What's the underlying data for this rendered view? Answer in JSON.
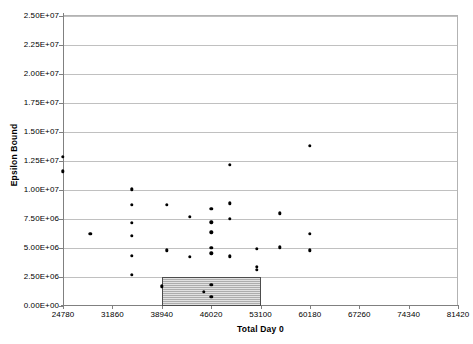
{
  "chart_data": {
    "type": "scatter",
    "title": "",
    "xlabel": "Total Day 0",
    "ylabel": "Epsilon Bound",
    "xlim": [
      24780,
      81420
    ],
    "ylim": [
      0,
      25000000
    ],
    "grid": true,
    "legend": false,
    "xticks": [
      "24780",
      "31860",
      "38940",
      "46020",
      "53100",
      "60180",
      "67260",
      "74340",
      "81420"
    ],
    "xtick_values": [
      24780,
      31860,
      38940,
      46020,
      53100,
      60180,
      67260,
      74340,
      81420
    ],
    "yticks": [
      "0.00E+00",
      "2.50E+06",
      "5.00E+06",
      "7.50E+06",
      "1.00E+07",
      "1.25E+07",
      "1.50E+07",
      "1.75E+07",
      "2.00E+07",
      "2.25E+07",
      "2.50E+07"
    ],
    "ytick_values": [
      0,
      2500000,
      5000000,
      7500000,
      10000000,
      12500000,
      15000000,
      17500000,
      20000000,
      22500000,
      25000000
    ],
    "points": [
      {
        "x": 24780,
        "y": 12850000
      },
      {
        "x": 24780,
        "y": 11600000
      },
      {
        "x": 28700,
        "y": 6200000
      },
      {
        "x": 34640,
        "y": 10050000
      },
      {
        "x": 34640,
        "y": 8700000
      },
      {
        "x": 34640,
        "y": 7150000
      },
      {
        "x": 34640,
        "y": 6050000
      },
      {
        "x": 34640,
        "y": 4350000
      },
      {
        "x": 34640,
        "y": 2700000
      },
      {
        "x": 38940,
        "y": 1700000
      },
      {
        "x": 39700,
        "y": 8750000
      },
      {
        "x": 39700,
        "y": 4800000
      },
      {
        "x": 43000,
        "y": 7700000
      },
      {
        "x": 43000,
        "y": 4250000
      },
      {
        "x": 45000,
        "y": 1200000
      },
      {
        "x": 46020,
        "y": 8400000
      },
      {
        "x": 46020,
        "y": 7200000
      },
      {
        "x": 46020,
        "y": 6350000
      },
      {
        "x": 46020,
        "y": 5000000
      },
      {
        "x": 46020,
        "y": 4550000
      },
      {
        "x": 46020,
        "y": 1850000
      },
      {
        "x": 46020,
        "y": 800000
      },
      {
        "x": 48700,
        "y": 12150000
      },
      {
        "x": 48700,
        "y": 8850000
      },
      {
        "x": 48700,
        "y": 7500000
      },
      {
        "x": 48700,
        "y": 4300000
      },
      {
        "x": 52600,
        "y": 4950000
      },
      {
        "x": 52600,
        "y": 3400000
      },
      {
        "x": 52600,
        "y": 3100000
      },
      {
        "x": 55900,
        "y": 8000000
      },
      {
        "x": 55900,
        "y": 5050000
      },
      {
        "x": 60180,
        "y": 13800000
      },
      {
        "x": 60180,
        "y": 6250000
      },
      {
        "x": 60180,
        "y": 4800000
      }
    ],
    "highlight_box": {
      "x0": 38940,
      "x1": 53100,
      "y0": 0,
      "y1": 2500000,
      "fill_color": "#bfbfbf",
      "border_color": "#4d4d4d"
    }
  }
}
